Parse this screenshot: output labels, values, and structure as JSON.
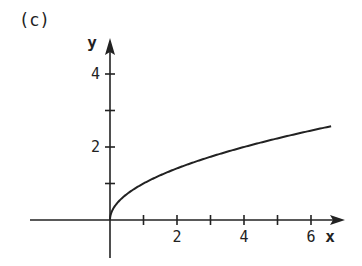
{
  "panel_label": "(c)",
  "chart_data": {
    "type": "line",
    "title": "",
    "function": "y = sqrt(x)",
    "xlabel": "x",
    "ylabel": "y",
    "xlim": [
      -3,
      7
    ],
    "ylim": [
      -1,
      5
    ],
    "x_ticks": [
      1,
      2,
      3,
      4,
      5,
      6
    ],
    "x_tick_labels": [
      "2",
      "4",
      "6"
    ],
    "x_tick_label_values": [
      2,
      4,
      6
    ],
    "y_ticks": [
      1,
      2,
      3,
      4
    ],
    "y_tick_labels": [
      "2",
      "4"
    ],
    "y_tick_label_values": [
      2,
      4
    ],
    "grid": false,
    "legend": null,
    "series": [
      {
        "name": "y = sqrt(x)",
        "x": [
          0,
          0.25,
          0.5,
          1,
          1.5,
          2,
          3,
          4,
          5,
          6,
          6.6
        ],
        "values": [
          0,
          0.5,
          0.71,
          1,
          1.22,
          1.41,
          1.73,
          2,
          2.24,
          2.45,
          2.57
        ]
      }
    ]
  }
}
